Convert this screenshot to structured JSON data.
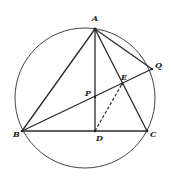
{
  "diagram": {
    "type": "geometry",
    "circle": {
      "cx": 85,
      "cy": 98,
      "r": 70
    },
    "points": {
      "A": {
        "x": 95,
        "y": 29,
        "label": "A",
        "lx": 92,
        "ly": 21
      },
      "Q": {
        "x": 152,
        "y": 69,
        "label": "Q",
        "lx": 155,
        "ly": 68
      },
      "E": {
        "x": 122,
        "y": 84,
        "label": "E",
        "lx": 121,
        "ly": 80
      },
      "P": {
        "x": 95,
        "y": 97,
        "label": "P",
        "lx": 86,
        "ly": 96
      },
      "B": {
        "x": 22,
        "y": 131,
        "label": "B",
        "lx": 13,
        "ly": 137
      },
      "D": {
        "x": 95,
        "y": 131,
        "label": "D",
        "lx": 96,
        "ly": 141
      },
      "C": {
        "x": 147,
        "y": 131,
        "label": "C",
        "lx": 149,
        "ly": 137
      }
    },
    "segments": [
      [
        "A",
        "B"
      ],
      [
        "A",
        "C"
      ],
      [
        "A",
        "Q"
      ],
      [
        "A",
        "D"
      ],
      [
        "B",
        "C"
      ],
      [
        "B",
        "Q"
      ]
    ],
    "dashed_segments": [
      [
        "D",
        "E"
      ]
    ]
  }
}
